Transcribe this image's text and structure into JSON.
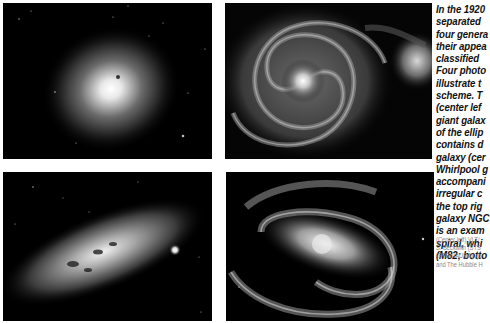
{
  "figure": {
    "panels": [
      {
        "position": "top-left",
        "subject": "giant elliptical galaxy",
        "alt": "Giant elliptical galaxy"
      },
      {
        "position": "top-right",
        "subject": "Whirlpool galaxy with irregular companion",
        "alt": "Whirlpool galaxy and companion"
      },
      {
        "position": "bottom-left",
        "subject": "irregular galaxy M82",
        "alt": "M82 irregular galaxy"
      },
      {
        "position": "bottom-right",
        "subject": "barred spiral galaxy",
        "alt": "Barred spiral galaxy"
      }
    ],
    "caption_lines": [
      "In the 1920",
      "separated",
      "four genera",
      "their appea",
      "classified",
      "Four photo",
      "illustrate t",
      "scheme. T",
      "(center lef",
      "giant galax",
      "of the ellip",
      "contains d",
      "galaxy (cer",
      "Whirlpool g",
      "accompani",
      "irregular c",
      "the top rig",
      "galaxy NGC",
      "is an exam",
      "spiral, whi",
      "(M82; botto"
    ],
    "credit_lines": [
      "(Center left) VLT/",
      "S. Beckwith (STS",
      "(STScI/AURA); (b",
      "and The Hubble H"
    ]
  }
}
